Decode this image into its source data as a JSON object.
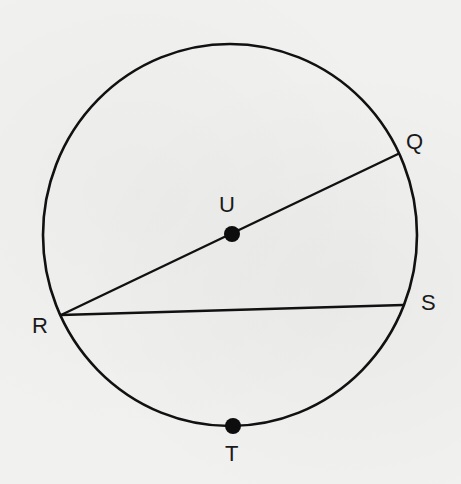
{
  "diagram": {
    "type": "circle-geometry",
    "circle": {
      "cx": 230,
      "cy": 235,
      "rx": 187,
      "ry": 191,
      "stroke": "#111111"
    },
    "points": [
      {
        "id": "Q",
        "label": "Q",
        "x": 398,
        "y": 154,
        "dot": false,
        "label_x": 406,
        "label_y": 131
      },
      {
        "id": "U",
        "label": "U",
        "x": 232,
        "y": 234,
        "dot": true,
        "label_x": 220,
        "label_y": 194
      },
      {
        "id": "R",
        "label": "R",
        "x": 61,
        "y": 315,
        "dot": false,
        "label_x": 32,
        "label_y": 316
      },
      {
        "id": "S",
        "label": "S",
        "x": 403,
        "y": 305,
        "dot": false,
        "label_x": 421,
        "label_y": 293
      },
      {
        "id": "T",
        "label": "T",
        "x": 233,
        "y": 426,
        "dot": true,
        "label_x": 225,
        "label_y": 443
      }
    ],
    "segments": [
      {
        "id": "RQ",
        "from": "R",
        "to": "Q",
        "description": "diameter through center U"
      },
      {
        "id": "RS",
        "from": "R",
        "to": "S",
        "description": "chord"
      }
    ]
  },
  "labels": {
    "Q": "Q",
    "U": "U",
    "R": "R",
    "S": "S",
    "T": "T"
  }
}
